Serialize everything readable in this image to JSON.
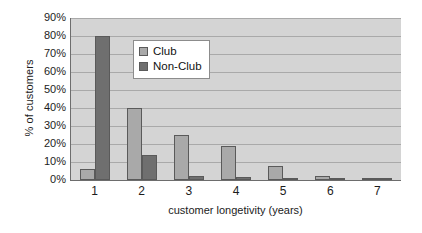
{
  "chart_data": {
    "type": "bar",
    "title": "",
    "xlabel": "customer longetivity (years)",
    "ylabel": "% of customers",
    "categories": [
      "1",
      "2",
      "3",
      "4",
      "5",
      "6",
      "7"
    ],
    "series": [
      {
        "name": "Club",
        "color": "#a9a9a9",
        "values": [
          6,
          40,
          25,
          19,
          8,
          2,
          1
        ]
      },
      {
        "name": "Non-Club",
        "color": "#6f6f6f",
        "values": [
          80,
          14,
          2,
          1.5,
          1,
          1,
          0.5
        ]
      }
    ],
    "ylim": [
      0,
      90
    ],
    "yticks": [
      "0%",
      "10%",
      "20%",
      "30%",
      "40%",
      "50%",
      "60%",
      "70%",
      "80%",
      "90%"
    ],
    "ytick_values": [
      0,
      10,
      20,
      30,
      40,
      50,
      60,
      70,
      80,
      90
    ],
    "grid": true,
    "legend_position": "inside-top-left",
    "plot_background": "#d4d4d4",
    "axis_color": "#6d6d6d",
    "gridline_color": "#a9a9a9"
  },
  "legend": {
    "entries": [
      {
        "label": "Club",
        "swatch": "club"
      },
      {
        "label": "Non-Club",
        "swatch": "nonclub"
      }
    ]
  }
}
